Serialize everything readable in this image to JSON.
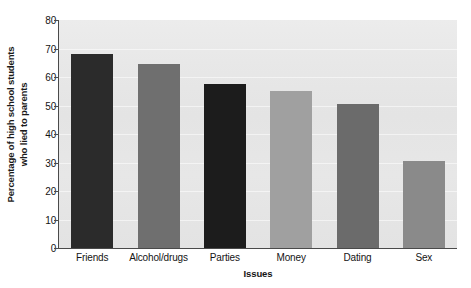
{
  "chart_data": {
    "type": "bar",
    "title": "",
    "subtitle": "",
    "xlabel": "Issues",
    "ylabel": "Percentage of high school students who lied to parents",
    "ylabel_lines": [
      "Percentage of high school students",
      "who lied to parents"
    ],
    "categories": [
      "Friends",
      "Alcohol/drugs",
      "Parties",
      "Money",
      "Dating",
      "Sex"
    ],
    "values": [
      68,
      64.5,
      57.5,
      55,
      50.5,
      30.5
    ],
    "ylim": [
      0,
      80
    ],
    "yticks": [
      0,
      10,
      20,
      30,
      40,
      50,
      60,
      70,
      80
    ],
    "ytick_labels": [
      "0",
      "10",
      "20",
      "30",
      "40",
      "50",
      "60",
      "70",
      "80"
    ],
    "grid": true,
    "legend": "none",
    "bar_colors": [
      "#2b2b2b",
      "#6f6f6f",
      "#1c1c1c",
      "#a0a0a0",
      "#6b6b6b",
      "#8a8a8a"
    ],
    "plot_background": "#e6e6e6",
    "axis_color": "#4a4a4a",
    "text_color": "#141414"
  }
}
